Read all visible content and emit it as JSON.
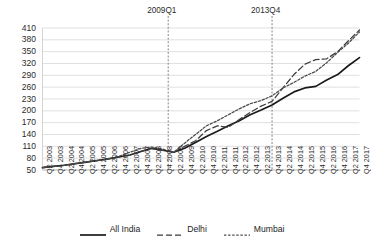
{
  "chart_data": {
    "type": "line",
    "title": "",
    "xlabel": "",
    "ylabel": "",
    "ylim": [
      50,
      410
    ],
    "yticks": [
      50,
      80,
      110,
      140,
      170,
      200,
      230,
      260,
      290,
      320,
      350,
      380,
      410
    ],
    "grid": true,
    "legend_position": "bottom",
    "categories": [
      "Q2 2003",
      "Q4 2003",
      "Q2 2004",
      "Q4 2004",
      "Q2 2005",
      "Q4 2005",
      "Q2 2006",
      "Q4 2006",
      "Q2 2007",
      "Q4 2007",
      "Q2 2008",
      "Q4 2008",
      "Q2 2009",
      "Q4 2009",
      "Q2 2010",
      "Q4 2010",
      "Q2 2011",
      "Q4 2011",
      "Q2 2012",
      "Q4 2012",
      "Q2 2013",
      "Q4 2013",
      "Q2 2014",
      "Q4 2014",
      "Q2 2015",
      "Q4 2015",
      "Q2 2016",
      "Q4 2016",
      "Q2 2017",
      "Q4 2017"
    ],
    "series": [
      {
        "name": "All India",
        "style": "solid",
        "color": "#1a1a1a",
        "values": [
          56,
          59,
          62,
          66,
          70,
          74,
          78,
          83,
          88,
          97,
          105,
          100,
          95,
          105,
          120,
          135,
          148,
          162,
          175,
          190,
          202,
          215,
          232,
          248,
          258,
          262,
          278,
          292,
          315,
          335
        ]
      },
      {
        "name": "Delhi",
        "style": "dashed",
        "color": "#3d3d3d",
        "values": [
          56,
          59,
          62,
          66,
          70,
          74,
          78,
          83,
          88,
          97,
          105,
          100,
          95,
          110,
          124,
          150,
          162,
          158,
          178,
          196,
          212,
          224,
          258,
          292,
          318,
          330,
          332,
          350,
          378,
          405
        ]
      },
      {
        "name": "Mumbai",
        "style": "dotted",
        "color": "#4a4a4a",
        "values": [
          56,
          59,
          62,
          66,
          70,
          74,
          78,
          85,
          95,
          105,
          108,
          103,
          95,
          118,
          140,
          162,
          175,
          190,
          205,
          218,
          226,
          238,
          258,
          272,
          288,
          300,
          322,
          348,
          372,
          400
        ]
      }
    ],
    "annotations": [
      {
        "label": "2009Q1",
        "x_category": "Q2 2009",
        "x_offset": -0.5
      },
      {
        "label": "2013Q4",
        "x_category": "Q4 2013",
        "x_offset": 0
      }
    ]
  }
}
